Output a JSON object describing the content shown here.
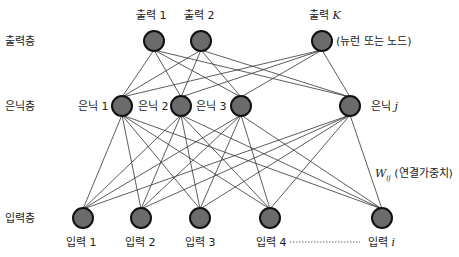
{
  "layers": {
    "output_label": "출력층",
    "hidden_label": "은닉층",
    "input_label": "입력층"
  },
  "output_nodes": [
    {
      "label": "출력 1",
      "x": 154,
      "y": 41
    },
    {
      "label": "출력 2",
      "x": 201,
      "y": 41
    },
    {
      "label": "출력",
      "var": "K",
      "x": 322,
      "y": 41
    }
  ],
  "hidden_nodes": [
    {
      "label": "은닉 1",
      "x": 122,
      "y": 106
    },
    {
      "label": "은닉 2",
      "x": 181,
      "y": 106
    },
    {
      "label": "은닉 3",
      "x": 241,
      "y": 106
    },
    {
      "label": "은닉",
      "var": "j",
      "x": 350,
      "y": 106
    }
  ],
  "input_nodes": [
    {
      "label": "입력 1",
      "x": 83,
      "y": 218
    },
    {
      "label": "입력 2",
      "x": 141,
      "y": 218
    },
    {
      "label": "입력 3",
      "x": 200,
      "y": 218
    },
    {
      "label": "입력 4",
      "x": 270,
      "y": 218
    },
    {
      "label": "입력",
      "var": "i",
      "x": 382,
      "y": 218
    }
  ],
  "annotations": {
    "neuron_note": "(뉴런 또는 노드)",
    "weight_symbol": "W",
    "weight_subscript": "ij",
    "weight_note": "(연결가중치)"
  },
  "style": {
    "node_fill": "#6b6b6b",
    "node_stroke": "#111111",
    "edge_color": "#333333",
    "node_radius": 10
  }
}
